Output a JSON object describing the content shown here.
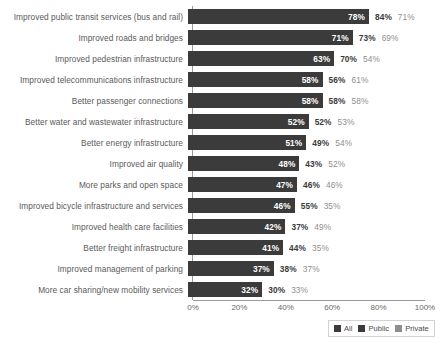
{
  "chart_data": {
    "type": "bar",
    "orientation": "horizontal",
    "title": "",
    "xlabel": "",
    "ylabel": "",
    "xlim": [
      0,
      100
    ],
    "xticks": [
      "0%",
      "20%",
      "40%",
      "60%",
      "80%",
      "100%"
    ],
    "xtick_values": [
      0,
      20,
      40,
      60,
      80,
      100
    ],
    "grid": false,
    "legend_position": "bottom-right",
    "value_suffix": "%",
    "categories": [
      "Improved public transit services (bus and rail)",
      "Improved roads and bridges",
      "Improved pedestrian infrastructure",
      "Improved telecommunications infrastructure",
      "Better passenger connections",
      "Better water and wastewater infrastructure",
      "Better energy infrastructure",
      "Improved air quality",
      "More parks and open space",
      "Improved bicycle infrastructure and services",
      "Improved health care facilities",
      "Better freight infrastructure",
      "Improved management of parking",
      "More car sharing/new mobility services"
    ],
    "series": [
      {
        "name": "All",
        "color": "#3b3b3b",
        "values": [
          78,
          71,
          63,
          58,
          58,
          52,
          51,
          48,
          47,
          46,
          42,
          41,
          37,
          32
        ],
        "labels": [
          "78%",
          "71%",
          "63%",
          "58%",
          "58%",
          "52%",
          "51%",
          "48%",
          "47%",
          "46%",
          "42%",
          "41%",
          "37%",
          "32%"
        ]
      },
      {
        "name": "Public",
        "color": "#3b3b3b",
        "values": [
          84,
          73,
          70,
          56,
          58,
          52,
          49,
          43,
          46,
          55,
          37,
          44,
          38,
          30
        ],
        "labels": [
          "84%",
          "73%",
          "70%",
          "56%",
          "58%",
          "52%",
          "49%",
          "43%",
          "46%",
          "55%",
          "37%",
          "44%",
          "38%",
          "30%"
        ]
      },
      {
        "name": "Private",
        "color": "#8e8e8e",
        "values": [
          71,
          69,
          54,
          61,
          58,
          53,
          54,
          52,
          46,
          35,
          49,
          35,
          37,
          33
        ],
        "labels": [
          "71%",
          "69%",
          "54%",
          "61%",
          "58%",
          "53%",
          "54%",
          "52%",
          "46%",
          "35%",
          "49%",
          "35%",
          "37%",
          "33%"
        ]
      }
    ]
  },
  "legend": {
    "items": [
      {
        "label": "All",
        "color": "#3b3b3b"
      },
      {
        "label": "Public",
        "color": "#3b3b3b"
      },
      {
        "label": "Private",
        "color": "#8e8e8e"
      }
    ]
  }
}
